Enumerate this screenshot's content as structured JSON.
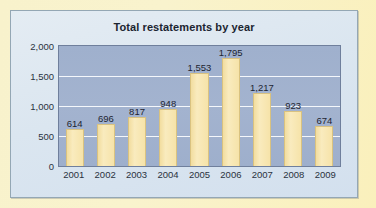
{
  "chart_data": {
    "type": "bar",
    "title": "Total restatements by year",
    "xlabel": "",
    "ylabel": "",
    "categories": [
      "2001",
      "2002",
      "2003",
      "2004",
      "2005",
      "2006",
      "2007",
      "2008",
      "2009"
    ],
    "values": [
      614,
      696,
      817,
      948,
      1553,
      1795,
      1217,
      923,
      674
    ],
    "value_labels": [
      "614",
      "696",
      "817",
      "948",
      "1,553",
      "1,795",
      "1,217",
      "923",
      "674"
    ],
    "ylim": [
      0,
      2000
    ],
    "yticks": [
      0,
      500,
      1000,
      1500,
      2000
    ],
    "ytick_labels": [
      "0",
      "500",
      "1,000",
      "1,500",
      "2,000"
    ],
    "grid": true,
    "legend": false,
    "colors": {
      "bar_fill": "#f6e3a9",
      "bar_edge": "#d9c280",
      "plot_background": "#a1b1ce",
      "gridline": "#f4f7fb",
      "card_background": "#dde8f1",
      "outer_background": "#f9f1c6",
      "title_text": "#1b2430",
      "tick_text": "#2a3240"
    }
  }
}
